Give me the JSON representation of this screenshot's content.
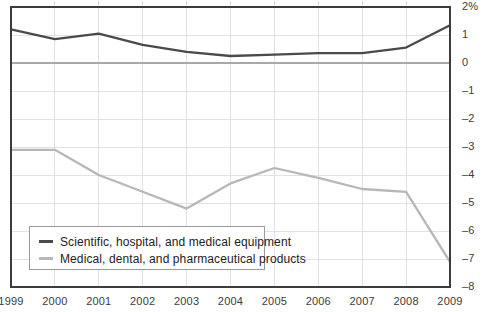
{
  "chart_data": {
    "type": "line",
    "title": "",
    "subtitle": "",
    "xlabel": "",
    "ylabel": "",
    "categories": [
      "1999",
      "2000",
      "2001",
      "2002",
      "2003",
      "2004",
      "2005",
      "2006",
      "2007",
      "2008",
      "2009"
    ],
    "x": [
      1999,
      2000,
      2001,
      2002,
      2003,
      2004,
      2005,
      2006,
      2007,
      2008,
      2009
    ],
    "series": [
      {
        "name": "Scientific, hospital, and medical equipment",
        "color": "#4a4a4a",
        "values": [
          1.2,
          0.85,
          1.05,
          0.65,
          0.4,
          0.25,
          0.3,
          0.35,
          0.35,
          0.55,
          1.35
        ]
      },
      {
        "name": "Medical, dental, and pharmaceutical products",
        "color": "#b7b7b7",
        "values": [
          -3.1,
          -3.1,
          -4.0,
          -4.6,
          -5.2,
          -4.3,
          -3.75,
          -4.1,
          -4.5,
          -4.6,
          -7.1
        ]
      }
    ],
    "ylim": [
      -8,
      2
    ],
    "xlim": [
      1999,
      2009
    ],
    "yticks": [
      2,
      1,
      0,
      -1,
      -2,
      -3,
      -4,
      -5,
      -6,
      -7,
      -8
    ],
    "ytick_labels": [
      "2%",
      "1",
      "0",
      "–1",
      "–2",
      "–3",
      "–4",
      "–5",
      "–6",
      "–7",
      "–8"
    ],
    "grid": true,
    "grid_color": "#e2e2e2",
    "zero_line_color": "#a8a8a8",
    "axis_color": "#3c3c3c",
    "legend_position": "bottom-left",
    "legend": [
      "Scientific, hospital, and medical equipment",
      "Medical, dental, and pharmaceutical products"
    ]
  },
  "legend": {
    "items": [
      {
        "label": "Scientific, hospital, and medical equipment",
        "color": "#4a4a4a"
      },
      {
        "label": "Medical, dental, and pharmaceutical products",
        "color": "#b7b7b7"
      }
    ]
  }
}
